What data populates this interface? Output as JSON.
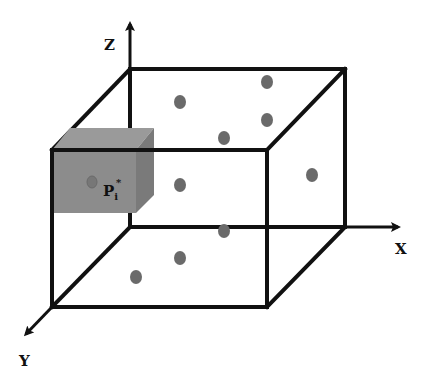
{
  "diagram": {
    "axes": {
      "x": {
        "label": "X"
      },
      "y": {
        "label": "Y"
      },
      "z": {
        "label": "Z"
      }
    },
    "highlight_cube": {
      "label_main": "P",
      "label_sub": "i",
      "label_sup": "*",
      "fill": "#8c8c8c"
    },
    "points_count": 9,
    "colors": {
      "edge": "#111111",
      "point": "#6a6a6a",
      "cube_front": "#8c8c8c",
      "cube_top": "#9a9a9a",
      "cube_side": "#7a7a7a"
    }
  }
}
